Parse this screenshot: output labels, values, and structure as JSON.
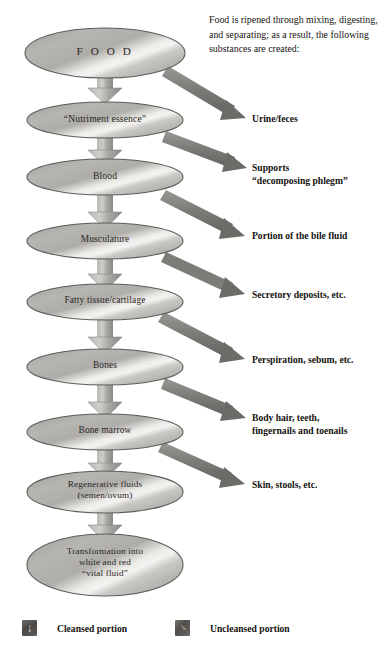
{
  "diagram": {
    "intro_text": "Food is ripened through mixing, digesting, and separating; as a result, the following substances are created:",
    "colors": {
      "ellipse_fill_dark": "#9d9c99",
      "ellipse_fill_light": "#e8e7e4",
      "ellipse_stroke": "#5e5c59",
      "arrow_gray": "#8d8b88",
      "branch_arrow_gray": "#73716e",
      "text": "#15130f",
      "page_background": "#ffffff"
    },
    "nodes": [
      {
        "id": "food",
        "label": "F O O D",
        "font_size": 11.2,
        "letter_spacing": 2.6,
        "cx": 105,
        "cy": 53,
        "rx": 80,
        "ry": 25
      },
      {
        "id": "nutriment-essence",
        "label": "“Nutriment essence”",
        "font_size": 9.6,
        "letter_spacing": 0.2,
        "cx": 105,
        "cy": 120,
        "rx": 78,
        "ry": 18
      },
      {
        "id": "blood",
        "label": "Blood",
        "font_size": 9.6,
        "letter_spacing": 0.2,
        "cx": 105,
        "cy": 177,
        "rx": 78,
        "ry": 18
      },
      {
        "id": "musculature",
        "label": "Musculature",
        "font_size": 9.4,
        "letter_spacing": 0.2,
        "cx": 105,
        "cy": 241,
        "rx": 78,
        "ry": 18
      },
      {
        "id": "fatty-tissue-cartilage",
        "label": "Fatty tissue/cartilage",
        "font_size": 9.4,
        "letter_spacing": 0.2,
        "cx": 105,
        "cy": 302,
        "rx": 78,
        "ry": 18
      },
      {
        "id": "bones",
        "label": "Bones",
        "font_size": 9.4,
        "letter_spacing": 0.2,
        "cx": 105,
        "cy": 367,
        "rx": 78,
        "ry": 18
      },
      {
        "id": "bone-marrow",
        "label": "Bone marrow",
        "font_size": 9.4,
        "letter_spacing": 0.2,
        "cx": 105,
        "cy": 432,
        "rx": 78,
        "ry": 18
      },
      {
        "id": "regenerative-fluids",
        "label": "Regenerative fluids\n(semen/ovum)",
        "font_size": 9.2,
        "letter_spacing": 0.2,
        "cx": 105,
        "cy": 492,
        "rx": 78,
        "ry": 21
      },
      {
        "id": "transformation",
        "label": "Transformation into\nwhite and red\n“vital fluid”",
        "font_size": 9.2,
        "letter_spacing": 0.2,
        "cx": 105,
        "cy": 565,
        "rx": 78,
        "ry": 31
      }
    ],
    "branch_labels": [
      {
        "id": "urine-feces",
        "text": "Urine/feces",
        "x": 252,
        "y": 112
      },
      {
        "id": "supports-phlegm",
        "text": "Supports\n“decomposing phlegm”",
        "x": 252,
        "y": 161
      },
      {
        "id": "bile-fluid",
        "text": "Portion of the bile fluid",
        "x": 252,
        "y": 229
      },
      {
        "id": "secretory-deposits",
        "text": "Secretory deposits, etc.",
        "x": 252,
        "y": 288
      },
      {
        "id": "perspiration-sebum",
        "text": "Perspiration, sebum, etc.",
        "x": 252,
        "y": 353
      },
      {
        "id": "body-hair-teeth",
        "text": "Body hair, teeth,\nfingernails and toenails",
        "x": 252,
        "y": 411
      },
      {
        "id": "skin-stools",
        "text": "Skin, stools, etc.",
        "x": 252,
        "y": 478
      }
    ],
    "legend": {
      "cleansed": {
        "label": "Cleansed portion",
        "icon": "down-arrow-icon",
        "glyph": "↓"
      },
      "uncleansed": {
        "label": "Uncleansed portion",
        "icon": "diagonal-arrow-icon",
        "glyph": "↘"
      }
    }
  }
}
